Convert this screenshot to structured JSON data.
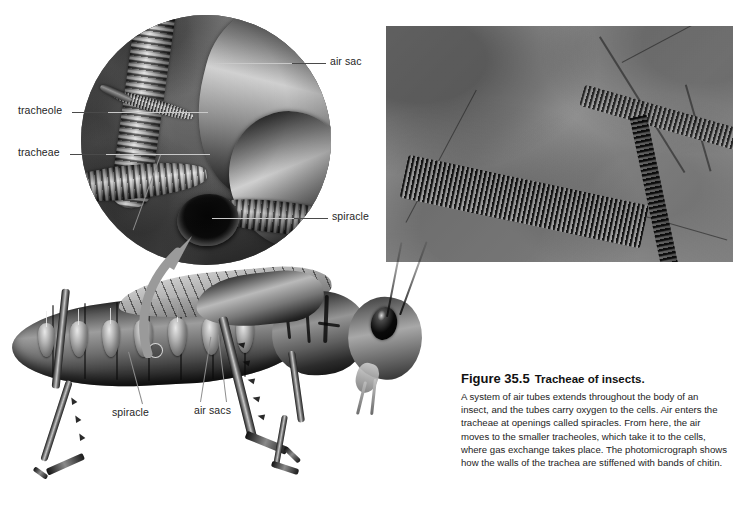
{
  "figure": {
    "number": "Figure 35.5",
    "title": "Tracheae of insects.",
    "caption": "A system of air tubes extends throughout the body of an insect, and the tubes carry oxygen to the cells. Air enters the tracheae at openings called spiracles. From here, the air moves to the smaller tracheoles, which take it to the cells, where gas exchange takes place. The photomicrograph shows how the walls of the trachea are stiffened with bands of chitin."
  },
  "labels": {
    "tracheole": "tracheole",
    "tracheae": "tracheae",
    "air_sac": "air sac",
    "spiracle_inset": "spiracle",
    "spiracle_body": "spiracle",
    "air_sacs_body": "air sacs"
  },
  "panels": {
    "inset": "circular-cutaway-of-insect-tracheal-system",
    "photomicrograph": "light-micrograph-of-chitin-banded-trachea",
    "organism": "grasshopper-lateral-view"
  },
  "colors": {
    "background": "#ffffff",
    "label_text": "#262626",
    "caption_text": "#1c1c1c",
    "heading_text": "#111111",
    "leader_line": "#4a4a4a",
    "leader_line_inner": "#c9c9c9",
    "arrow": "#9a9a9a"
  }
}
